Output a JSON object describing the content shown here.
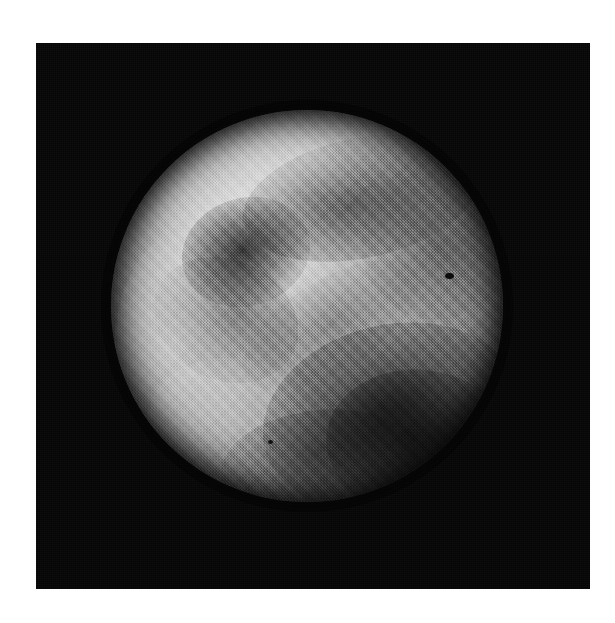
{
  "image": {
    "kind": "photograph",
    "subject": "planetary-disk",
    "caption": "",
    "colors": {
      "page_background": "#ffffff",
      "plate_background": "#050505",
      "disk_bright": "#d8d8d8",
      "disk_mid": "#9d9d9d",
      "disk_dark": "#262626",
      "albedo_dark": "#1a1a1a"
    },
    "plate": {
      "x": 36,
      "y": 43,
      "width": 554,
      "height": 546
    },
    "disk": {
      "center_x": 307,
      "center_y": 306,
      "radius": 196,
      "diameter": 392
    },
    "features": [
      {
        "name": "bright-northwest-limb",
        "type": "bright-region",
        "cx": 135,
        "cy": 110,
        "tone": "light"
      },
      {
        "name": "bright-west-limb",
        "type": "bright-region",
        "cx": 80,
        "cy": 235,
        "tone": "light"
      },
      {
        "name": "bright-southwest-limb",
        "type": "bright-region",
        "cx": 128,
        "cy": 325,
        "tone": "light"
      },
      {
        "name": "bright-north-polar-hood",
        "type": "bright-region",
        "cx": 210,
        "cy": 42,
        "tone": "light"
      },
      {
        "name": "dark-west-spot",
        "type": "albedo-marking",
        "cx": 135,
        "cy": 142,
        "tone": "dark"
      },
      {
        "name": "dark-north-band",
        "type": "albedo-marking",
        "cx": 250,
        "cy": 88,
        "tone": "medium-dark"
      },
      {
        "name": "dark-northeast-limb",
        "type": "albedo-marking",
        "cx": 325,
        "cy": 135,
        "tone": "medium-dark"
      },
      {
        "name": "dark-south-major",
        "type": "albedo-marking",
        "cx": 280,
        "cy": 307,
        "tone": "dark"
      },
      {
        "name": "dark-southeast",
        "type": "albedo-marking",
        "cx": 310,
        "cy": 335,
        "tone": "dark"
      },
      {
        "name": "dark-south-limb",
        "type": "albedo-marking",
        "cx": 210,
        "cy": 355,
        "tone": "medium-dark"
      },
      {
        "name": "dust-speck-northeast",
        "type": "print-defect",
        "cx": 338,
        "cy": 166,
        "tone": "black"
      },
      {
        "name": "dust-speck-south",
        "type": "print-defect",
        "cx": 159,
        "cy": 332,
        "tone": "black"
      }
    ],
    "texture": {
      "name": "halftone-screen",
      "description": "printed halftone dither pattern"
    }
  }
}
